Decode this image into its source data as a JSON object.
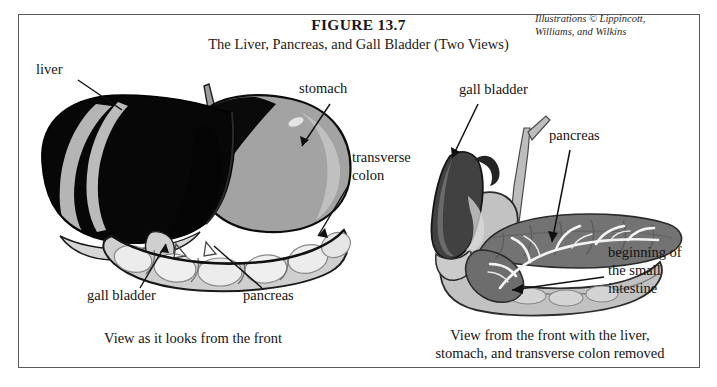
{
  "figure": {
    "number": "FIGURE 13.7",
    "subtitle": "The Liver, Pancreas, and Gall Bladder (Two Views)",
    "credit_line_1": "Illustrations © Lippincott,",
    "credit_line_2": "Williams, and Wilkins"
  },
  "left_view": {
    "caption": "View as it looks from the front",
    "labels": {
      "liver": "liver",
      "stomach": "stomach",
      "transverse_colon_line1": "transverse",
      "transverse_colon_line2": "colon",
      "gall_bladder": "gall bladder",
      "pancreas": "pancreas"
    }
  },
  "right_view": {
    "caption_line_1": "View from the front with the liver,",
    "caption_line_2": "stomach, and transverse colon removed",
    "labels": {
      "gall_bladder": "gall bladder",
      "pancreas": "pancreas",
      "small_intestine_line1": "beginning of",
      "small_intestine_line2": "the small",
      "small_intestine_line3": "intestine"
    }
  },
  "colors": {
    "frame_border": "#5a5a5a",
    "page_background": "#ffffff",
    "liver_dark": "#060606",
    "liver_highlight": "#b9b9b9",
    "stomach_gray": "#9e9e9e",
    "stomach_shadow": "#0a0a0a",
    "colon_light": "#e2e2e2",
    "colon_outline": "#3d3d3d",
    "pancreas_gray": "#6e6e6e",
    "pancreas_duct": "#f2f2f2",
    "gall_bladder_dark": "#3b3b3b",
    "duodenum_gray": "#b0b0b0",
    "text": "#141414"
  }
}
